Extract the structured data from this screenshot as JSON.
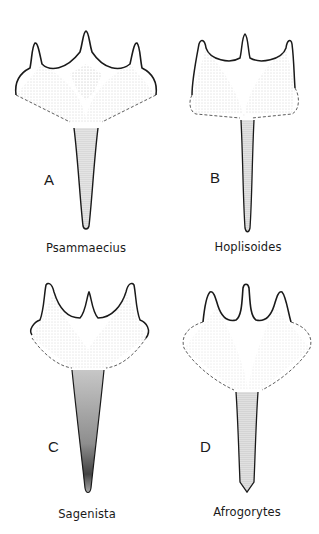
{
  "figure": {
    "panels": [
      {
        "letter": "A",
        "genus": "Psammaecius"
      },
      {
        "letter": "B",
        "genus": "Hoplisoides"
      },
      {
        "letter": "C",
        "genus": "Sagenista"
      },
      {
        "letter": "D",
        "genus": "Afrogorytes"
      }
    ],
    "colors": {
      "ink": "#1a1a1a",
      "stipple": "#6a6a6a",
      "background": "#ffffff"
    }
  }
}
